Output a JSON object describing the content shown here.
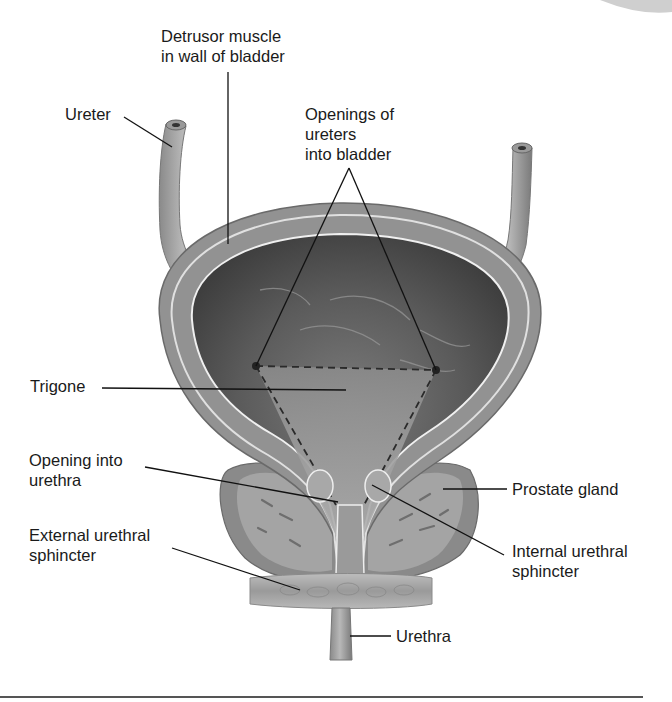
{
  "diagram": {
    "labels": {
      "detrusor": "Detrusor muscle\nin wall of bladder",
      "ureter": "Ureter",
      "openings_ureters": "Openings of\nureters\ninto bladder",
      "trigone": "Trigone",
      "opening_urethra": "Opening into\nurethra",
      "external_sphincter": "External urethral\nsphincter",
      "prostate": "Prostate gland",
      "internal_sphincter": "Internal urethral\nsphincter",
      "urethra": "Urethra"
    },
    "colors": {
      "background": "#ffffff",
      "wall": "#8e8e8e",
      "wall_light": "#b4b4b4",
      "lumen_dark": "#4a4a4a",
      "lumen_mid": "#6e6e6e",
      "trigone": "#9c9c9c",
      "prostate": "#8a8a8a",
      "prostate_inner": "#a2a2a2",
      "sphincter": "#a8a8a8",
      "leader": "#111111",
      "rule": "#555555"
    }
  }
}
